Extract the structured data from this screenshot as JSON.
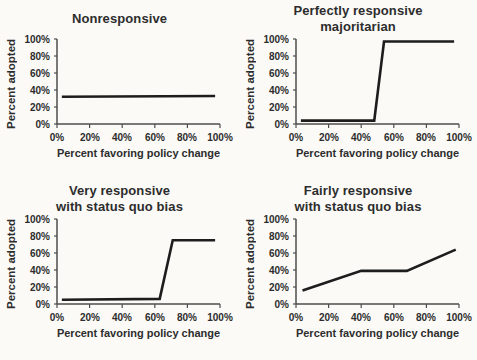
{
  "style": {
    "background": "#fbfaf7",
    "text_color": "#2d2d2d",
    "axis_color": "#4d4d4d",
    "line_color": "#1d1d1d"
  },
  "chart_data": [
    {
      "type": "line",
      "title": "Nonresponsive",
      "title_lines": [
        "Nonresponsive"
      ],
      "xlabel": "Percent favoring policy change",
      "ylabel": "Percent adopted",
      "x_tick_labels": [
        "0%",
        "20%",
        "40%",
        "60%",
        "80%",
        "100%"
      ],
      "y_tick_labels": [
        "100%",
        "80%",
        "60%",
        "40%",
        "20%",
        "0%"
      ],
      "xlim": [
        0,
        100
      ],
      "ylim": [
        0,
        100
      ],
      "grid": false,
      "legend": false,
      "x": [
        3,
        97
      ],
      "y": [
        32,
        33
      ]
    },
    {
      "type": "line",
      "title": "Perfectly responsive majoritarian",
      "title_lines": [
        "Perfectly responsive",
        "majoritarian"
      ],
      "xlabel": "Percent favoring policy change",
      "ylabel": "Percent adopted",
      "x_tick_labels": [
        "0%",
        "20%",
        "40%",
        "60%",
        "80%",
        "100%"
      ],
      "y_tick_labels": [
        "100%",
        "80%",
        "60%",
        "40%",
        "20%",
        "0%"
      ],
      "xlim": [
        0,
        100
      ],
      "ylim": [
        0,
        100
      ],
      "grid": false,
      "legend": false,
      "x": [
        3,
        48,
        54,
        97
      ],
      "y": [
        4,
        4,
        97,
        97
      ]
    },
    {
      "type": "line",
      "title": "Very responsive with status quo bias",
      "title_lines": [
        "Very responsive",
        "with status quo bias"
      ],
      "xlabel": "Percent favoring policy change",
      "ylabel": "Percent adopted",
      "x_tick_labels": [
        "0%",
        "20%",
        "40%",
        "60%",
        "80%",
        "100%"
      ],
      "y_tick_labels": [
        "100%",
        "80%",
        "60%",
        "40%",
        "20%",
        "0%"
      ],
      "xlim": [
        0,
        100
      ],
      "ylim": [
        0,
        100
      ],
      "grid": false,
      "legend": false,
      "x": [
        3,
        63,
        71,
        97
      ],
      "y": [
        5,
        6,
        75,
        75
      ]
    },
    {
      "type": "line",
      "title": "Fairly responsive with status quo bias",
      "title_lines": [
        "Fairly responsive",
        "with status quo bias"
      ],
      "xlabel": "Percent favoring policy change",
      "ylabel": "Percent adopted",
      "x_tick_labels": [
        "0%",
        "20%",
        "40%",
        "60%",
        "80%",
        "100%"
      ],
      "y_tick_labels": [
        "100%",
        "80%",
        "60%",
        "40%",
        "20%",
        "0%"
      ],
      "xlim": [
        0,
        100
      ],
      "ylim": [
        0,
        100
      ],
      "grid": false,
      "legend": false,
      "x": [
        4,
        40,
        68,
        98
      ],
      "y": [
        16,
        39,
        39,
        64
      ]
    }
  ]
}
